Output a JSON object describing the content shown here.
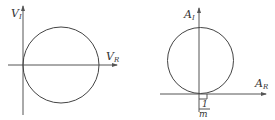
{
  "diagrams": [
    {
      "id": "left",
      "y_axis_label": "V",
      "y_axis_sub": "I",
      "x_axis_label": "V",
      "x_axis_sub": "R",
      "description": "Circle tangent to vertical axis at origin, centered on horizontal axis"
    },
    {
      "id": "right",
      "y_axis_label": "A",
      "y_axis_sub": "I",
      "x_axis_label": "A",
      "x_axis_sub": "R",
      "tick_numerator": "1",
      "tick_denominator": "m",
      "description": "Circle tangent to horizontal axis near origin, offset by 1/m"
    }
  ],
  "colors": {
    "line": "#444444",
    "text": "#333333",
    "background": "#ffffff"
  }
}
